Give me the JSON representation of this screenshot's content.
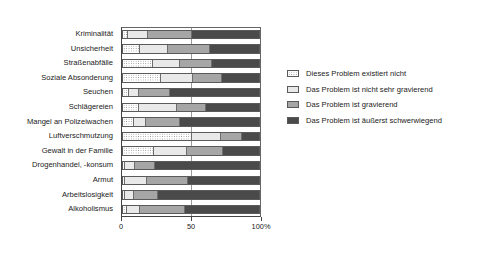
{
  "chart_data": {
    "type": "bar",
    "subtype": "stacked-horizontal-100-percent",
    "title": "",
    "xlabel": "",
    "ylabel": "",
    "xlim": [
      0,
      100
    ],
    "xticks": [
      "0",
      "50",
      "100%"
    ],
    "grid": "vertical-midline-only",
    "legend_position": "right",
    "orientation": "horizontal",
    "categories": [
      "Kriminalität",
      "Unsicherheit",
      "Straßenabfälle",
      "Soziale Absonderung",
      "Seuchen",
      "Schlägereien",
      "Mangel an Polizeiwachen",
      "Luftverschmutzung",
      "Gewalt in der Familie",
      "Drogenhandel, -konsum",
      "Armut",
      "Arbeitslosigkeit",
      "Alkoholismus"
    ],
    "series": [
      {
        "name": "Dieses Problem existiert nicht",
        "color": "#ffffff",
        "pattern": "dotted",
        "values": [
          3,
          12,
          21,
          27,
          4,
          11,
          7,
          50,
          22,
          1,
          1,
          1,
          2
        ]
      },
      {
        "name": "Das Problem ist nicht sehr gravierend",
        "color": "#e9e9e9",
        "pattern": "solid",
        "values": [
          15,
          20,
          20,
          24,
          7,
          28,
          9,
          21,
          24,
          7,
          16,
          6,
          10
        ]
      },
      {
        "name": "Das Problem ist gravierend",
        "color": "#a6a6a6",
        "pattern": "solid",
        "values": [
          32,
          31,
          24,
          21,
          23,
          21,
          25,
          16,
          27,
          15,
          30,
          18,
          33
        ]
      },
      {
        "name": "Das Problem ist äußerst schwerwiegend",
        "color": "#4a4a4a",
        "pattern": "solid",
        "values": [
          50,
          37,
          35,
          28,
          66,
          40,
          59,
          13,
          27,
          77,
          53,
          75,
          55
        ]
      }
    ]
  },
  "axis": {
    "ticks": [
      {
        "label": "0",
        "value": 0
      },
      {
        "label": "50",
        "value": 50
      },
      {
        "label": "100%",
        "value": 100
      }
    ]
  },
  "legend": {
    "items": [
      {
        "label": "Dieses Problem existiert nicht"
      },
      {
        "label": "Das Problem ist nicht sehr gravierend"
      },
      {
        "label": "Das Problem ist gravierend"
      },
      {
        "label": "Das Problem ist äußerst schwerwiegend"
      }
    ]
  }
}
